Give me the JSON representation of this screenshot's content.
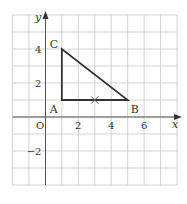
{
  "diagram": {
    "type": "coordinate-grid",
    "x_range": [
      -2,
      8
    ],
    "y_range": [
      -4,
      6
    ],
    "axis_labels": {
      "x": "x",
      "y": "y",
      "origin": "O"
    },
    "x_ticks": [
      {
        "value": 2,
        "label": "2"
      },
      {
        "value": 4,
        "label": "4"
      },
      {
        "value": 6,
        "label": "6"
      }
    ],
    "y_ticks": [
      {
        "value": 4,
        "label": "4"
      },
      {
        "value": 2,
        "label": "2"
      },
      {
        "value": -2,
        "label": "−2"
      }
    ],
    "points": [
      {
        "name": "A",
        "x": 1,
        "y": 1
      },
      {
        "name": "B",
        "x": 5,
        "y": 1
      },
      {
        "name": "C",
        "x": 1,
        "y": 4
      }
    ],
    "shape": {
      "name": "triangle ABC",
      "vertices": [
        "A",
        "B",
        "C"
      ]
    },
    "marked_point": {
      "symbol": "×",
      "x": 3,
      "y": 1
    },
    "colors": {
      "grid": "#c8c8c8",
      "axis": "#555555",
      "shape": "#333333",
      "text": "#333333"
    }
  }
}
